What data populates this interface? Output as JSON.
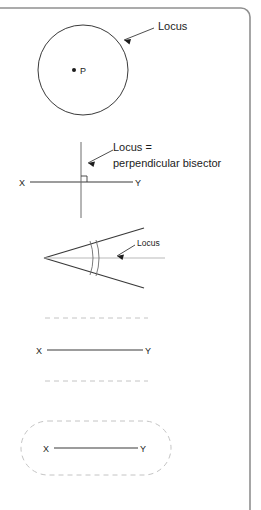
{
  "page": {
    "background_color": "#ffffff",
    "ink_color": "#3a3a3a",
    "text_color": "#1c1c1c",
    "faint_color": "#b9b9b9",
    "border_color": "#909090",
    "width": 261,
    "height": 510
  },
  "figures": [
    {
      "id": "circle-locus",
      "kind": "circle-locus-around-point",
      "center_label": "P",
      "callout_label": "Locus",
      "circle": {
        "cx": 83,
        "cy": 70,
        "r": 45
      },
      "point": {
        "x": 74,
        "y": 70
      }
    },
    {
      "id": "perpendicular-bisector-locus",
      "kind": "perpendicular-bisector",
      "endpoint_left_label": "X",
      "endpoint_right_label": "Y",
      "callout_line_1": "Locus =",
      "callout_line_2": "perpendicular bisector",
      "right_angle_marker": true,
      "segment": {
        "x1": 30,
        "y1": 182,
        "x2": 133,
        "y2": 182
      },
      "bisector": {
        "x": 81,
        "y1": 142,
        "y2": 218
      }
    },
    {
      "id": "angle-bisector-locus",
      "kind": "angle-bisector",
      "callout_label": "Locus",
      "vertex": {
        "x": 44,
        "y": 258
      },
      "arc_marks": 2
    },
    {
      "id": "parallel-lines-locus",
      "kind": "parallel-lines-either-side-of-segment",
      "endpoint_left_label": "X",
      "endpoint_right_label": "Y",
      "segment": {
        "x1": 47,
        "y1": 350,
        "x2": 143,
        "y2": 350
      },
      "dashed_line_above_y": 318,
      "dashed_line_below_y": 381
    },
    {
      "id": "capsule-locus",
      "kind": "equidistant-capsule-around-segment",
      "endpoint_left_label": "X",
      "endpoint_right_label": "Y",
      "segment": {
        "x1": 54,
        "y1": 448,
        "x2": 138,
        "y2": 448
      },
      "capsule": {
        "x": 21,
        "y": 421,
        "width": 150,
        "height": 54,
        "radius": 27
      }
    }
  ]
}
